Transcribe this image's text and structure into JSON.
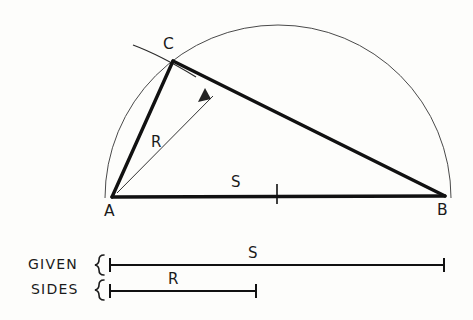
{
  "figure": {
    "title_text_present": false,
    "background_color": "#fdfdfb",
    "ink_color": "#111111",
    "light_ink_color": "#4a4a4a"
  },
  "construction": {
    "vertex_labels": {
      "a": "A",
      "b": "B",
      "c": "C"
    },
    "dimension_labels": {
      "radius": "R",
      "side": "S"
    },
    "vertices": {
      "a": {
        "x": 112,
        "y": 197
      },
      "b": {
        "x": 445,
        "y": 196
      },
      "c": {
        "x": 173,
        "y": 61
      }
    },
    "semicircle": {
      "center_x": 278.5,
      "center_y": 196.5,
      "radius": 173,
      "start_x": 105,
      "start_y": 196,
      "end_x": 452,
      "end_y": 196
    },
    "radius_arc": {
      "center_x": 112,
      "center_y": 197,
      "radius": 148
    },
    "midpoint_tick_x": 277,
    "label_positions": {
      "a": {
        "x": 104,
        "y": 215
      },
      "b": {
        "x": 438,
        "y": 214
      },
      "c": {
        "x": 166,
        "y": 48
      },
      "r": {
        "x": 151,
        "y": 146
      },
      "s": {
        "x": 232,
        "y": 186
      }
    },
    "radius_leader": {
      "tail_x": 117,
      "tail_y": 193,
      "head_x": 205,
      "head_y": 92
    }
  },
  "legend": {
    "line1": "GIVEN",
    "line2": "SIDES",
    "bars": [
      {
        "label": "S",
        "x1": 109,
        "x2": 445,
        "y": 265,
        "label_x": 250,
        "label_y": 257
      },
      {
        "label": "R",
        "x1": 109,
        "x2": 257,
        "y": 291,
        "label_x": 170,
        "label_y": 283
      }
    ],
    "text_positions": {
      "line1": {
        "x": 30,
        "y": 268
      },
      "line2": {
        "x": 32,
        "y": 293
      }
    },
    "brace_x": 96
  }
}
